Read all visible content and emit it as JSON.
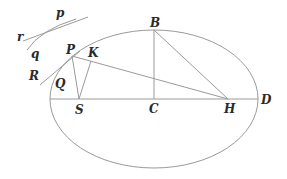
{
  "diagram": {
    "labels": {
      "p_small": "p",
      "r": "r",
      "q": "q",
      "R": "R",
      "P": "P",
      "K": "K",
      "Q": "Q",
      "S": "S",
      "C": "C",
      "B": "B",
      "H": "H",
      "D": "D"
    },
    "ellipse": {
      "cx": 154,
      "cy": 99,
      "rx": 104,
      "ry": 69
    },
    "points": {
      "P": [
        72,
        56
      ],
      "K": [
        91,
        61
      ],
      "S": [
        79,
        99
      ],
      "C": [
        154,
        99
      ],
      "B": [
        154,
        30
      ],
      "H": [
        228,
        99
      ],
      "D": [
        258,
        99
      ]
    },
    "colors": {
      "line": "#9a9a9a",
      "text": "#2a2a2a",
      "background": "#ffffff"
    }
  }
}
